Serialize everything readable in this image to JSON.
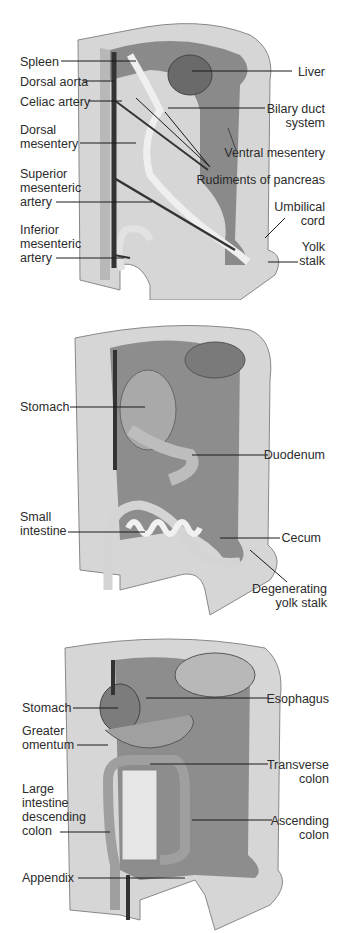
{
  "figure": {
    "panels": [
      {
        "id": "early-embryo",
        "labels_left": [
          {
            "text": "Spleen"
          },
          {
            "text": "Dorsal aorta"
          },
          {
            "text": "Celiac artery"
          },
          {
            "text": "Dorsal\nmesentery"
          },
          {
            "text": "Superior\nmesenteric\nartery"
          },
          {
            "text": "Inferior\nmesenteric\nartery"
          }
        ],
        "labels_right": [
          {
            "text": "Liver"
          },
          {
            "text": "Bilary duct\nsystem"
          },
          {
            "text": "Ventral mesentery"
          },
          {
            "text": "Rudiments of pancreas"
          },
          {
            "text": "Umbilical\ncord"
          },
          {
            "text": "Yolk\nstalk"
          }
        ]
      },
      {
        "id": "mid-stage",
        "labels_left": [
          {
            "text": "Stomach"
          },
          {
            "text": "Small\nintestine"
          }
        ],
        "labels_right": [
          {
            "text": "Duodenum"
          },
          {
            "text": "Cecum"
          },
          {
            "text": "Degenerating\nyolk stalk"
          }
        ]
      },
      {
        "id": "late-stage",
        "labels_left": [
          {
            "text": "Stomach"
          },
          {
            "text": "Greater\nomentum"
          },
          {
            "text": "Large\nintestine\ndescending\ncolon"
          },
          {
            "text": "Appendix"
          }
        ],
        "labels_right": [
          {
            "text": "Esophagus"
          },
          {
            "text": "Transverse\ncolon"
          },
          {
            "text": "Ascending\ncolon"
          }
        ]
      }
    ],
    "colors": {
      "wall_light": "#d9d9d9",
      "wall_mid": "#a8a8a8",
      "cavity_dark": "#6f6f6f",
      "tube_light": "#ececec",
      "vessel": "#3a3a3a",
      "liver": "#8a8a8a",
      "leader": "#1a1a1a"
    }
  }
}
